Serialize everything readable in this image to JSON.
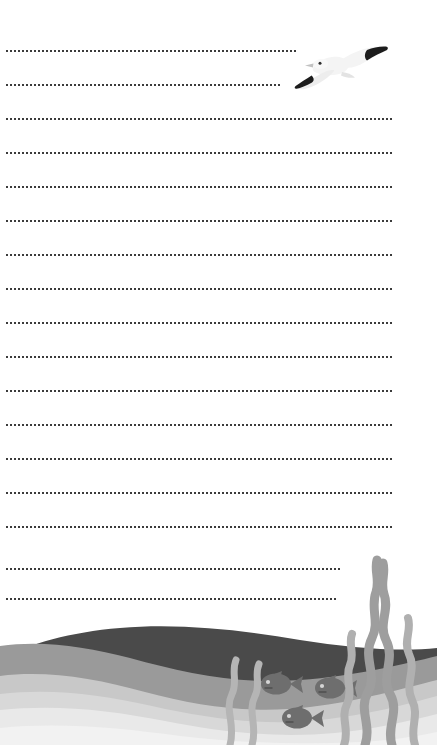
{
  "page": {
    "title": "Seaside Stationery Writing Paper",
    "width": 437,
    "height": 745,
    "background_color": "#ffffff",
    "orientation": "portrait"
  },
  "writing_area": {
    "description": "Dotted horizontal ruling lines for handwriting",
    "line_count": 17,
    "line_style": "dotted",
    "dot_color": "#3b3b3b",
    "dot_size_px": 2,
    "dot_spacing_px": 4,
    "left_margin_px": 6,
    "line_spacing_px": 34,
    "lines": [
      {
        "index": 1,
        "y": 50,
        "x_start": 6,
        "x_end": 296,
        "note": "shortened for seagull"
      },
      {
        "index": 2,
        "y": 84,
        "x_start": 6,
        "x_end": 281,
        "note": "shortened for seagull"
      },
      {
        "index": 3,
        "y": 118,
        "x_start": 6,
        "x_end": 392,
        "note": "full width"
      },
      {
        "index": 4,
        "y": 152,
        "x_start": 6,
        "x_end": 392,
        "note": "full width"
      },
      {
        "index": 5,
        "y": 186,
        "x_start": 6,
        "x_end": 392,
        "note": "full width"
      },
      {
        "index": 6,
        "y": 220,
        "x_start": 6,
        "x_end": 392,
        "note": "full width"
      },
      {
        "index": 7,
        "y": 254,
        "x_start": 6,
        "x_end": 392,
        "note": "full width"
      },
      {
        "index": 8,
        "y": 288,
        "x_start": 6,
        "x_end": 392,
        "note": "full width"
      },
      {
        "index": 9,
        "y": 322,
        "x_start": 6,
        "x_end": 392,
        "note": "full width"
      },
      {
        "index": 10,
        "y": 356,
        "x_start": 6,
        "x_end": 392,
        "note": "full width"
      },
      {
        "index": 11,
        "y": 390,
        "x_start": 6,
        "x_end": 392,
        "note": "full width"
      },
      {
        "index": 12,
        "y": 424,
        "x_start": 6,
        "x_end": 392,
        "note": "full width"
      },
      {
        "index": 13,
        "y": 458,
        "x_start": 6,
        "x_end": 392,
        "note": "full width"
      },
      {
        "index": 14,
        "y": 492,
        "x_start": 6,
        "x_end": 392,
        "note": "full width"
      },
      {
        "index": 15,
        "y": 526,
        "x_start": 6,
        "x_end": 392,
        "note": "full width"
      },
      {
        "index": 16,
        "y": 568,
        "x_start": 6,
        "x_end": 341,
        "note": "shortened for seaweed"
      },
      {
        "index": 17,
        "y": 598,
        "x_start": 6,
        "x_end": 336,
        "note": "shortened for seaweed"
      }
    ]
  },
  "illustrations": {
    "seagull": {
      "name": "flying-seagull",
      "position": {
        "x": 293,
        "y": 41,
        "width": 96,
        "height": 58
      },
      "body_color": "#f4f4f4",
      "shadow_color": "#d9d9d9",
      "wingtip_color": "#1c1c1c",
      "beak_color": "#bdbdbd",
      "eye_color": "#2a2a2a",
      "pose": "gliding with wings spread, facing right"
    },
    "ocean": {
      "name": "layered-ocean-waves",
      "position": {
        "x": 0,
        "y": 528,
        "width": 437,
        "height": 217
      },
      "layers": [
        {
          "name": "dark-wave",
          "color": "#4a4a4a"
        },
        {
          "name": "mid-gray-wave",
          "color": "#9a9a9a"
        },
        {
          "name": "light-gray-wave",
          "color": "#c8c8c8"
        },
        {
          "name": "pale-gray-wave",
          "color": "#d8d8d8"
        },
        {
          "name": "lightest-wave",
          "color": "#e9e9e9"
        },
        {
          "name": "foam-wave",
          "color": "#f2f2f2"
        }
      ]
    },
    "fish": {
      "name": "swimming-fish",
      "count": 3,
      "body_color": "#6e6e6e",
      "eye_color": "#d5d5d5",
      "facing": "left",
      "items": [
        {
          "index": 1,
          "x": 262,
          "y": 672,
          "size": 44
        },
        {
          "index": 2,
          "x": 316,
          "y": 676,
          "size": 44
        },
        {
          "index": 3,
          "x": 283,
          "y": 706,
          "size": 44
        }
      ]
    },
    "seaweed": {
      "name": "seaweed-strands",
      "color": "#9e9e9e",
      "secondary_color": "#b5b5b5",
      "strand_count": 4,
      "position": {
        "x": 330,
        "y": 545,
        "width": 107,
        "height": 200
      },
      "description": "Tall intertwining wavy kelp strands rising from the seabed"
    }
  },
  "colors": {
    "paper": "#ffffff",
    "rule_dot": "#3b3b3b",
    "wave_dark": "#4a4a4a",
    "wave_mid": "#9a9a9a",
    "wave_light": "#c8c8c8",
    "wave_pale": "#e9e9e9",
    "fish": "#6e6e6e",
    "seaweed": "#9e9e9e",
    "gull_white": "#f4f4f4",
    "gull_wingtip": "#1c1c1c"
  }
}
